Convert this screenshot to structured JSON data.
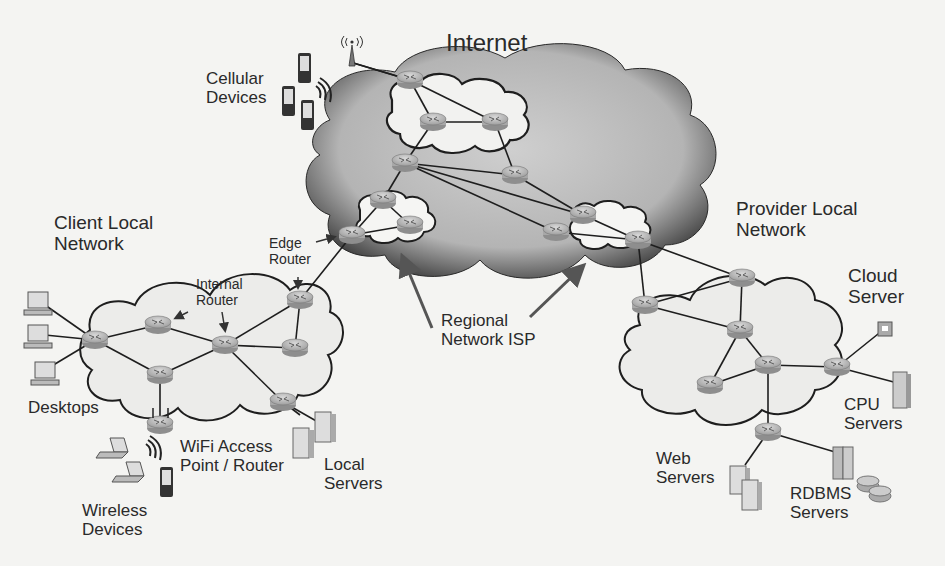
{
  "diagram": {
    "title": "Internet",
    "colors": {
      "background": "#f4f4f2",
      "internet_cloud_dark": "#5a5a5a",
      "internet_cloud_light": "#c8c8c8",
      "local_cloud_fill": "#ececea",
      "router_fill": "#b9b9b9",
      "link": "#1e1e1e",
      "arrow": "#555555",
      "text": "#2a2a2a"
    },
    "labels": {
      "internet": "Internet",
      "cellular_line1": "Cellular",
      "cellular_line2": "Devices",
      "client_line1": "Client Local",
      "client_line2": "Network",
      "edge_line1": "Edge",
      "edge_line2": "Router",
      "internal_line1": "Internal",
      "internal_line2": "Router",
      "regional_line1": "Regional",
      "regional_line2": "Network ISP",
      "provider_line1": "Provider Local",
      "provider_line2": "Network",
      "cloud_server_line1": "Cloud",
      "cloud_server_line2": "Server",
      "desktops": "Desktops",
      "wifi_line1": "WiFi Access",
      "wifi_line2": "Point / Router",
      "local_servers_line1": "Local",
      "local_servers_line2": "Servers",
      "wireless_line1": "Wireless",
      "wireless_line2": "Devices",
      "cpu_line1": "CPU",
      "cpu_line2": "Servers",
      "web_line1": "Web",
      "web_line2": "Servers",
      "rdbms_line1": "RDBMS",
      "rdbms_line2": "Servers"
    },
    "regions": [
      {
        "name": "Internet",
        "type": "cloud"
      },
      {
        "name": "Client Local Network",
        "type": "cloud"
      },
      {
        "name": "Provider Local Network",
        "type": "cloud"
      },
      {
        "name": "Regional Network ISP",
        "type": "sub-cloud",
        "count": 2
      }
    ],
    "icons": [
      "router-icon",
      "cell-tower-icon",
      "cell-phone-icon",
      "desktop-icon",
      "laptop-icon",
      "server-icon",
      "database-icon",
      "wifi-signal-icon"
    ]
  }
}
